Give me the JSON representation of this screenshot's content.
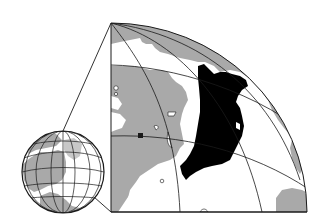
{
  "figure": {
    "colors": {
      "background": "#ffffff",
      "ocean": "#ffffff",
      "land": "#a9a9a9",
      "highlight_region": "#000000",
      "graticule": "#1a1a1a"
    },
    "globe": {
      "cx": 63,
      "cy": 172,
      "r": 41
    },
    "zoom_panel": {
      "corner_x": 111,
      "top_y": 23,
      "bottom_y": 212,
      "right_x": 307
    }
  }
}
